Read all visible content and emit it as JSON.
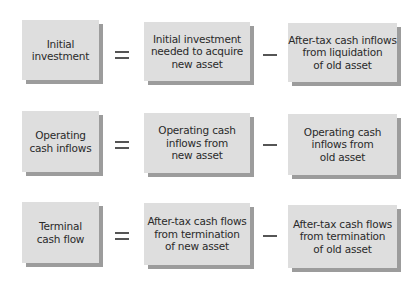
{
  "rows": [
    {
      "name": "initial-investment",
      "lhs": "Initial\ninvestment",
      "operator": "=",
      "term1": "Initial investment\nneeded to acquire\nnew asset",
      "operator2": "−",
      "term2": "After-tax cash inflows\nfrom liquidation\nof old asset"
    },
    {
      "name": "operating-cash-inflows",
      "lhs": "Operating\ncash inflows",
      "operator": "=",
      "term1": "Operating cash\ninflows from\nnew asset",
      "operator2": "−",
      "term2": "Operating cash\ninflows from\nold asset"
    },
    {
      "name": "terminal-cash-flow",
      "lhs": "Terminal\ncash flow",
      "operator": "=",
      "term1": "After-tax cash flows\nfrom termination\nof new asset",
      "operator2": "−",
      "term2": "After-tax cash flows\nfrom termination\nof old asset"
    }
  ],
  "colors": {
    "box_fill": "#dedede",
    "box_shadow": "#9c9c9c",
    "text": "#2a2a2a",
    "background": "#ffffff"
  }
}
